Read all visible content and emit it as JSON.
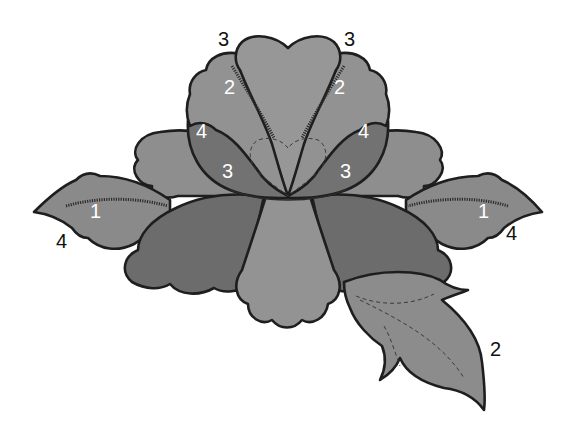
{
  "diagram": {
    "colors": {
      "zone_1": "#8c8c8c",
      "zone_2": "#939393",
      "zone_3": "#6e6e6e",
      "zone_4": "#747474",
      "outline": "#1e1e1e",
      "background": "#ffffff"
    },
    "labels": {
      "top_left_3": "3",
      "top_right_3": "3",
      "inner_left_2": "2",
      "inner_right_2": "2",
      "cup_left_4": "4",
      "cup_right_4": "4",
      "cup_left_3": "3",
      "cup_right_3": "3",
      "leaf_left_1": "1",
      "leaf_left_4": "4",
      "leaf_right_1": "1",
      "leaf_right_4": "4",
      "big_leaf_2": "2"
    },
    "parts": [
      {
        "name": "top-center-petal",
        "zone": "3"
      },
      {
        "name": "left-inner-petal",
        "zone": "2"
      },
      {
        "name": "right-inner-petal",
        "zone": "2"
      },
      {
        "name": "left-cup-side",
        "zones": [
          "4",
          "3"
        ]
      },
      {
        "name": "right-cup-side",
        "zones": [
          "4",
          "3"
        ]
      },
      {
        "name": "heart-center",
        "stitch": "dashed"
      },
      {
        "name": "left-leaf",
        "zones": [
          "1",
          "4"
        ]
      },
      {
        "name": "right-leaf",
        "zones": [
          "1",
          "4"
        ]
      },
      {
        "name": "lower-right-leaf",
        "zone": "2"
      },
      {
        "name": "lower-left-petal",
        "zone": "dark"
      },
      {
        "name": "lower-center-petal",
        "zone": "light"
      },
      {
        "name": "lower-right-petal",
        "zone": "dark"
      },
      {
        "name": "back-left-petal",
        "zone": "medium"
      },
      {
        "name": "back-right-petal",
        "zone": "medium"
      }
    ]
  }
}
